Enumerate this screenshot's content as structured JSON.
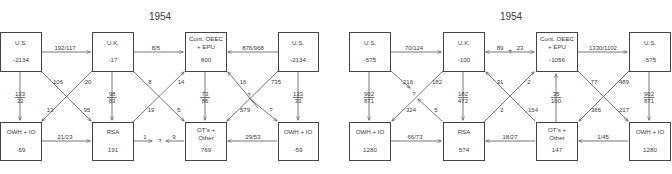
{
  "diagrams": [
    {
      "title": "1954",
      "nodes": {
        "us_left": {
          "label": "U.S.",
          "value": "-2134"
        },
        "uk": {
          "label": "U.K.",
          "value": "-17"
        },
        "cont": {
          "label1": "Cont. OEEC",
          "label2": "+ EPU",
          "value": "800"
        },
        "us_right": {
          "label": "U.S.",
          "value": "-2134"
        },
        "owh_left": {
          "label": "OWH + IO",
          "value": "-59"
        },
        "rsa": {
          "label": "RSA",
          "value": "191"
        },
        "ots": {
          "label1": "OT's +",
          "label2": "Other",
          "value": "769"
        },
        "owh_right": {
          "label": "OWH + IO",
          "value": "-59"
        }
      },
      "flows": {
        "us_uk": "192/117",
        "uk_cont": "8/5",
        "usr_cont": "876/968",
        "us_owh_num": "133",
        "us_owh_den": "33",
        "uk_rsa_num": "98",
        "uk_rsa_den": "83",
        "cont_ots_num": "73",
        "cont_ots_den": "86",
        "usr_owhr_num": "133",
        "usr_owhr_den": "33",
        "us_rsa": "106",
        "owh_uk": "20",
        "uk_owh": "13",
        "us_rsa_end": "95",
        "uk_ots": "8",
        "rsa_cont": "14",
        "rsa_cont_end": "19",
        "uk_ots_end": "5",
        "ots_cont": "16",
        "usr_ots": "735",
        "cross_q": "?",
        "usr_ots_end": "579",
        "cont_owhr": "?",
        "owh_rsa": "21/23",
        "rsa_q": "1",
        "q_mark": "?",
        "ots_q": "9",
        "owhr_ots": "29/53"
      }
    },
    {
      "title": "1954",
      "nodes": {
        "us_left": {
          "label": "U.S.",
          "value": "-575"
        },
        "uk": {
          "label": "U.K.",
          "value": "-100"
        },
        "cont": {
          "label1": "Cont. OEEC",
          "label2": "+ EPU",
          "value": "-1056"
        },
        "us_right": {
          "label": "U.S.",
          "value": "-575"
        },
        "owh_left": {
          "label": "OWH + IO",
          "value": "1280"
        },
        "rsa": {
          "label": "RSA",
          "value": "574"
        },
        "ots": {
          "label1": "OT's +",
          "label2": "Other",
          "value": "147"
        },
        "owh_right": {
          "label": "OWH + IO",
          "value": "1280"
        }
      },
      "flows": {
        "us_uk": "70/124",
        "uk_cont_a": "89",
        "uk_cont_q": "?",
        "uk_cont_b": "23",
        "cont_usr": "1330/1102",
        "us_owh_num": "902",
        "us_owh_den": "871",
        "uk_rsa_num": "182",
        "uk_rsa_den": "472",
        "ots_cont_num": "35",
        "ots_cont_den": "100",
        "usr_owhr_num": "902",
        "usr_owhr_den": "871",
        "us_cross": "216",
        "uk_owh": "182",
        "cross_q": "?",
        "owh_end": "324",
        "rsa_cross": "5",
        "ots_uk": "31",
        "rsa_cont": "2",
        "rsa_cont_end": "2",
        "uk_ots_end": "154",
        "cont_owhr": "77",
        "usr_ots": "489",
        "usr_ots_end": "366",
        "cont_owhr_end": "217",
        "owh_rsa": "66/73",
        "ots_rsa": "18/27",
        "owhr_ots": "1/45"
      }
    }
  ]
}
